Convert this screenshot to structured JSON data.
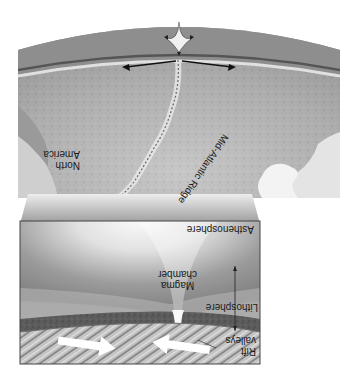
{
  "diagram": {
    "orientation": "rotated 180 degrees",
    "labels": {
      "continent": [
        "North",
        "America"
      ],
      "ridge": "Mid-Atlantic Ridge",
      "asthenosphere": "Asthenosphere",
      "magma_chamber": [
        "Magma",
        "chamber"
      ],
      "lithosphere": "Lithosphere",
      "rift_valleys": [
        "Rift",
        "valleys"
      ]
    },
    "colors": {
      "background": "#ffffff",
      "mantle_gray": "#8a8a8a",
      "lithosphere_dark": "#5a5a5a",
      "magma_light": "#f2f2f2",
      "seafloor": "#b8b8b8",
      "arrow_white": "#ffffff",
      "arrow_black": "#111111"
    }
  }
}
